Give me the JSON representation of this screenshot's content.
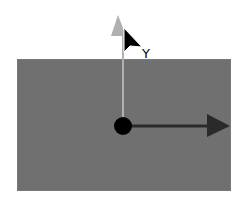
{
  "viewport": {
    "background_color": "#707070"
  },
  "gizmo": {
    "origin": {
      "x": 123,
      "y": 126
    },
    "y_axis": {
      "label": "Y",
      "color": "#b0b0b0",
      "direction": "up"
    },
    "x_axis": {
      "color": "#2a2a2a",
      "direction": "right"
    },
    "pivot_color": "#000000"
  },
  "cursor": {
    "icon": "arrow-pointer-icon",
    "x": 124,
    "y": 28
  }
}
